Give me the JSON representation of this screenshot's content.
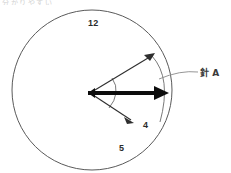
{
  "page": {
    "background_color": "#ffffff",
    "width": 231,
    "height": 173,
    "cropped_top_text": "分かりやすい"
  },
  "diagram": {
    "type": "clock-face-hand-angle",
    "stroke_color": "#4a4a4a",
    "bold_stroke_color": "#111111",
    "clock_face": {
      "name": "clock-circle",
      "center_x": 92,
      "center_y": 90,
      "radius": 80,
      "stroke_width": 1
    },
    "pivot": {
      "x": 90,
      "y": 93
    },
    "hour_numbers": [
      {
        "label": "12",
        "x": 88,
        "y": 19
      },
      {
        "label": "4",
        "x": 143,
        "y": 121
      },
      {
        "label": "5",
        "x": 119,
        "y": 144
      }
    ],
    "hands": [
      {
        "name": "thin-hand-upper",
        "style": "thin",
        "tip_x": 155,
        "tip_y": 53,
        "stroke_width": 1
      },
      {
        "name": "bold-hand-horizontal",
        "style": "bold",
        "tip_x": 168,
        "tip_y": 93,
        "stroke_width": 4.2
      },
      {
        "name": "thin-hand-lower",
        "style": "thin",
        "tip_x": 133,
        "tip_y": 122,
        "stroke_width": 1
      }
    ],
    "angle_arcs": [
      {
        "name": "inner-angle-arc-upper",
        "radius": 25
      },
      {
        "name": "inner-angle-arc-lower",
        "radius": 25
      },
      {
        "name": "outer-sweep-arc",
        "radius": 72
      }
    ]
  },
  "callout": {
    "label": "針 A",
    "label_x": 200,
    "label_y": 69,
    "leader_start_x": 159,
    "leader_start_y": 79,
    "leader_end_x": 198,
    "leader_end_y": 73
  }
}
